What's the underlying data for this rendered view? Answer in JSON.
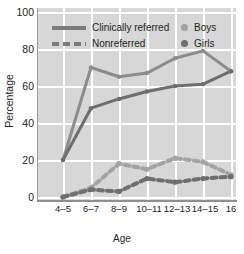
{
  "chart_data": {
    "type": "line",
    "title": "",
    "xlabel": "Age",
    "ylabel": "Percentage",
    "categories": [
      "4–5",
      "6–7",
      "8–9",
      "10–11",
      "12–13",
      "14–15",
      "16"
    ],
    "ylim": [
      0,
      100
    ],
    "yticks": [
      0,
      20,
      40,
      60,
      80,
      100
    ],
    "grid": true,
    "legend_position": "top-inside",
    "series": [
      {
        "name": "Clinically referred — Boys",
        "group": "Clinically referred",
        "sex": "Boys",
        "style": "solid",
        "color": "#8c8c8c",
        "values": [
          20,
          70,
          65,
          67,
          75,
          79,
          68
        ]
      },
      {
        "name": "Clinically referred — Girls",
        "group": "Clinically referred",
        "sex": "Girls",
        "style": "solid",
        "color": "#6e6e6e",
        "values": [
          20,
          48,
          53,
          57,
          60,
          61,
          68
        ]
      },
      {
        "name": "Nonreferred — Boys",
        "group": "Nonreferred",
        "sex": "Boys",
        "style": "dashed",
        "color": "#a3a3a3",
        "values": [
          0,
          5,
          18,
          15,
          21,
          19,
          12
        ]
      },
      {
        "name": "Nonreferred — Girls",
        "group": "Nonreferred",
        "sex": "Girls",
        "style": "dashed",
        "color": "#6e6e6e",
        "values": [
          0,
          4,
          3,
          10,
          8,
          10,
          11
        ]
      }
    ]
  },
  "axis": {
    "y_title": "Percentage",
    "x_title": "Age",
    "y_ticks": [
      "100",
      "80",
      "60",
      "40",
      "20",
      "0"
    ],
    "x_ticks": [
      "4–5",
      "6–7",
      "8–9",
      "10–11",
      "12–13",
      "14–15",
      "16"
    ]
  },
  "legend": {
    "clinically_referred_label": "Clinically referred",
    "nonreferred_label": "Nonreferred",
    "boys_label": "Boys",
    "girls_label": "Girls",
    "boys_color": "#a3a3a3",
    "girls_color": "#6e6e6e",
    "line_color": "#7b7b7b"
  },
  "colors": {
    "plot_background": "#d7d7d7",
    "gridline": "#ffffff",
    "axis": "#8f8f8f",
    "text": "#231f20"
  }
}
